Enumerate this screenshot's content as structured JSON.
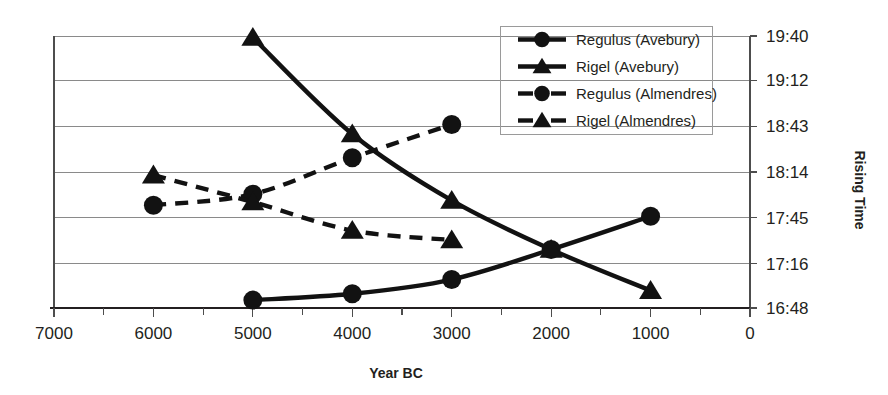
{
  "chart_data": {
    "type": "line",
    "title": "",
    "xlabel": "Year BC",
    "ylabel": "Rising Time",
    "x_ticks": [
      7000,
      6000,
      5000,
      4000,
      3000,
      2000,
      1000,
      0
    ],
    "x_tick_labels": [
      "7000",
      "6000",
      "5000",
      "4000",
      "3000",
      "2000",
      "1000",
      "0"
    ],
    "xlim": [
      7000,
      0
    ],
    "x_axis_reversed": true,
    "y_ticks": [
      1180,
      1152,
      1123,
      1094,
      1065,
      1036,
      1008
    ],
    "y_tick_labels": [
      "19:40",
      "19:12",
      "18:43",
      "18:14",
      "17:45",
      "17:16",
      "16:48"
    ],
    "ylim": [
      1008,
      1180
    ],
    "grid": true,
    "legend_position": "top-right",
    "series": [
      {
        "name": "Regulus (Avebury)",
        "marker": "circle",
        "line_style": "solid",
        "x": [
          5000,
          4000,
          3000,
          2000,
          1000
        ],
        "y": [
          1013,
          1017,
          1026,
          1045,
          1066
        ],
        "y_labels": [
          "16:53",
          "16:57",
          "17:06",
          "17:45",
          "18:26"
        ]
      },
      {
        "name": "Rigel (Avebury)",
        "marker": "triangle",
        "line_style": "solid",
        "x": [
          5000,
          4000,
          3000,
          2000,
          1000
        ],
        "y": [
          1179,
          1118,
          1076,
          1045,
          1019
        ],
        "y_labels": [
          "19:39",
          "18:38",
          "17:56",
          "17:45",
          "16:59"
        ]
      },
      {
        "name": "Regulus (Almendres)",
        "marker": "circle",
        "line_style": "dashed",
        "x": [
          6000,
          5000,
          4000,
          3000
        ],
        "y": [
          1073,
          1080,
          1103,
          1124
        ],
        "y_labels": [
          "17:53",
          "18:00",
          "18:23",
          "18:44"
        ]
      },
      {
        "name": "Rigel (Almendres)",
        "marker": "triangle",
        "line_style": "dashed",
        "x": [
          6000,
          5000,
          4000,
          3000
        ],
        "y": [
          1092,
          1075,
          1057,
          1051
        ],
        "y_labels": [
          "18:12",
          "17:55",
          "17:37",
          "17:31"
        ]
      }
    ]
  },
  "legend": {
    "items": [
      {
        "label": "Regulus (Avebury)",
        "marker": "circle",
        "line_style": "solid"
      },
      {
        "label": "Rigel (Avebury)",
        "marker": "triangle",
        "line_style": "solid"
      },
      {
        "label": "Regulus (Almendres)",
        "marker": "circle",
        "line_style": "dashed"
      },
      {
        "label": "Rigel (Almendres)",
        "marker": "triangle",
        "line_style": "dashed"
      }
    ]
  },
  "colors": {
    "series": "#121212",
    "gridline": "#8a8a8a",
    "axis": "#4d4d4d",
    "text": "#231f20",
    "background": "#ffffff"
  }
}
